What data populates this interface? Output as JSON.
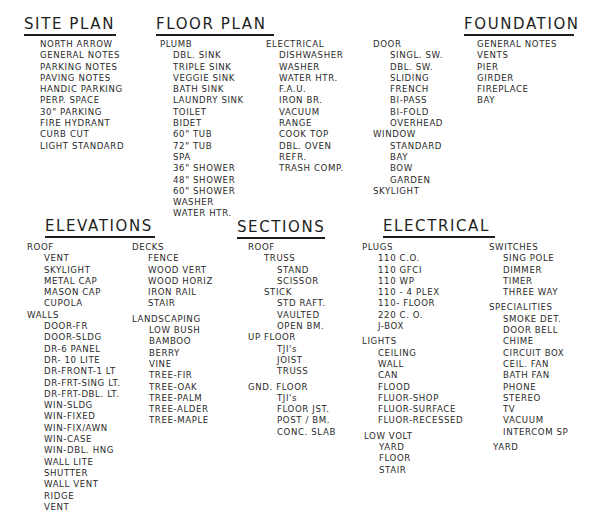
{
  "site_plan": {
    "title": "SITE PLAN",
    "items": [
      "NORTH ARROW",
      "GENERAL NOTES",
      "PARKING NOTES",
      "PAVING NOTES",
      "HANDIC PARKING",
      "PERP. SPACE",
      "30\" PARKING",
      "FIRE HYDRANT",
      "CURB CUT",
      "LIGHT STANDARD"
    ]
  },
  "floor_plan": {
    "title": "FLOOR PLAN",
    "plumb": {
      "label": "PLUMB",
      "items": [
        "DBL. SINK",
        "TRIPLE SINK",
        "VEGGIE SINK",
        "BATH SINK",
        "LAUNDRY SINK",
        "TOILET",
        "BIDET",
        "60\" TUB",
        "72\" TUB",
        "SPA",
        "36\" SHOWER",
        "48\" SHOWER",
        "60\" SHOWER",
        "WASHER",
        "WATER HTR."
      ]
    },
    "electrical": {
      "label": "ELECTRICAL",
      "items": [
        "DISHWASHER",
        "WASHER",
        "WATER HTR.",
        "F.A.U.",
        "IRON BR.",
        "VACUUM",
        "RANGE",
        "COOK TOP",
        "DBL. OVEN",
        "REFR.",
        "TRASH COMP."
      ]
    },
    "door": {
      "label": "DOOR",
      "items": [
        "SINGL. SW.",
        "DBL. SW.",
        "SLIDING",
        "FRENCH",
        "BI-PASS",
        "BI-FOLD",
        "OVERHEAD"
      ]
    },
    "window": {
      "label": "WINDOW",
      "items": [
        "STANDARD",
        "BAY",
        "BOW",
        "GARDEN"
      ]
    },
    "skylight": "SKYLIGHT"
  },
  "foundation": {
    "title": "FOUNDATION",
    "items": [
      "GENERAL NOTES",
      "VENTS",
      "PIER",
      "GIRDER",
      "FIREPLACE",
      "BAY"
    ]
  },
  "elevations": {
    "title": "ELEVATIONS",
    "roof": {
      "label": "ROOF",
      "items": [
        "VENT",
        "SKYLIGHT",
        "METAL CAP",
        "MASON CAP",
        "CUPOLA"
      ]
    },
    "walls": {
      "label": "WALLS",
      "items": [
        "DOOR-FR",
        "DOOR-SLDG",
        "DR-6 PANEL",
        "DR- 10 LITE",
        "DR-FRONT-1 LT",
        "DR-FRT-SING LT.",
        "DR-FRT-DBL. LT.",
        "WIN-SLDG",
        "WIN-FIXED",
        "WIN-FIX/AWN",
        "WIN-CASE",
        "WIN-DBL. HNG",
        "WALL LITE",
        "SHUTTER",
        "WALL VENT",
        "RIDGE",
        "VENT"
      ]
    },
    "decks": {
      "label": "DECKS",
      "items": [
        "FENCE",
        "WOOD VERT",
        "WOOD HORIZ",
        "IRON RAIL",
        "STAIR"
      ]
    },
    "landscaping": {
      "label": "LANDSCAPING",
      "items": [
        "LOW BUSH",
        "BAMBOO",
        "BERRY",
        "VINE",
        "TREE-FIR",
        "TREE-OAK",
        "TREE-PALM",
        "TREE-ALDER",
        "TREE-MAPLE"
      ]
    }
  },
  "sections": {
    "title": "SECTIONS",
    "roof": "ROOF",
    "truss": "TRUSS",
    "truss_items": [
      "STAND",
      "SCISSOR"
    ],
    "stick": "STICK",
    "stick_items": [
      "STD RAFT.",
      "VAULTED",
      "OPEN BM."
    ],
    "up_floor": "UP FLOOR",
    "up_floor_items": [
      "TJI's",
      "JOIST",
      "TRUSS"
    ],
    "gnd_floor": "GND. FLOOR",
    "gnd_floor_items": [
      "TJI's",
      "FLOOR JST.",
      "POST / BM.",
      "CONC. SLAB"
    ]
  },
  "electrical": {
    "title": "ELECTRICAL",
    "plugs": {
      "label": "PLUGS",
      "items": [
        "110 C.O.",
        "110 GFCI",
        "110 WP",
        "110 - 4 PLEX",
        "110- FLOOR",
        "220 C. O.",
        "J-BOX"
      ]
    },
    "lights": {
      "label": "LIGHTS",
      "items": [
        "CEILING",
        "WALL",
        "CAN",
        "FLOOD",
        "FLUOR-SHOP",
        "FLUOR-SURFACE",
        "FLUOR-RECESSED"
      ]
    },
    "low_volt": {
      "label": "LOW VOLT",
      "items": [
        "YARD",
        "FLOOR",
        "STAIR"
      ]
    },
    "switches": {
      "label": "SWITCHES",
      "items": [
        "SING POLE",
        "DIMMER",
        "TIMER",
        "THREE WAY"
      ]
    },
    "specialities": {
      "label": "SPECIALITIES",
      "items": [
        "SMOKE DET.",
        "DOOR BELL",
        "CHIME",
        "CIRCUIT BOX",
        "CEIL. FAN",
        "BATH FAN",
        "PHONE",
        "STEREO",
        "TV",
        "VACUUM",
        "INTERCOM SP"
      ]
    },
    "yard": "YARD"
  }
}
